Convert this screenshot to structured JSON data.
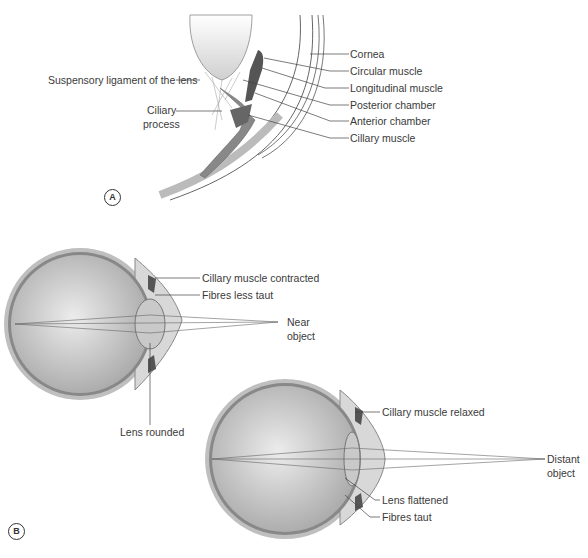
{
  "panel_a": {
    "marker": "A",
    "labels": {
      "suspensory_ligament": "Suspensory ligament of the lens",
      "ciliary_process_1": "Ciliary",
      "ciliary_process_2": "process",
      "cornea": "Cornea",
      "circular_muscle": "Circular muscle",
      "longitudinal_muscle": "Longitudinal muscle",
      "posterior_chamber": "Posterior chamber",
      "anterior_chamber": "Anterior chamber",
      "ciliary_muscle": "Cillary muscle"
    }
  },
  "panel_b": {
    "marker": "B",
    "near": {
      "muscle": "Cillary muscle contracted",
      "fibres": "Fibres less taut",
      "object_1": "Near",
      "object_2": "object",
      "lens": "Lens rounded"
    },
    "distant": {
      "muscle": "Cillary muscle relaxed",
      "object_1": "Distant",
      "object_2": "object",
      "lens": "Lens flattened",
      "fibres": "Fibres taut"
    }
  },
  "colors": {
    "eye_fill": "#b8b8b8",
    "eye_highlight": "#e6e6e6",
    "sclera": "#9a9a9a",
    "muscle_dark": "#555555",
    "line": "#444444"
  }
}
